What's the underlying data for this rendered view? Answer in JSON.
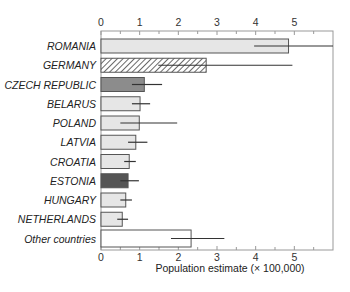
{
  "chart_data": {
    "type": "bar",
    "orientation": "horizontal",
    "title": "",
    "xlabel": "Population estimate (× 100,000)",
    "ylabel": "",
    "xlim": [
      0,
      6
    ],
    "x_ticks": [
      0,
      1,
      2,
      3,
      4,
      5
    ],
    "x_tick_labels": [
      "0",
      "1",
      "2",
      "3",
      "4",
      "5"
    ],
    "minor_ticks_every": 0.5,
    "axis_labels_top_and_bottom": true,
    "grid": false,
    "legend": null,
    "categories": [
      "ROMANIA",
      "GERMANY",
      "CZECH REPUBLIC",
      "BELARUS",
      "POLAND",
      "LATVIA",
      "CROATIA",
      "ESTONIA",
      "HUNGARY",
      "NETHERLANDS",
      "Other countries"
    ],
    "values": [
      4.85,
      2.72,
      1.12,
      1.01,
      0.99,
      0.9,
      0.73,
      0.7,
      0.64,
      0.55,
      2.33
    ],
    "error_low": [
      3.96,
      1.48,
      0.8,
      0.8,
      0.5,
      0.7,
      0.6,
      0.5,
      0.5,
      0.42,
      1.81
    ],
    "error_high": [
      6.0,
      4.95,
      1.58,
      1.27,
      1.97,
      1.2,
      0.9,
      0.98,
      0.8,
      0.7,
      3.19
    ],
    "fills": [
      "#e6e6e6",
      "hatch",
      "#8c8c8c",
      "#e6e6e6",
      "#e6e6e6",
      "#e6e6e6",
      "#e6e6e6",
      "#555555",
      "#e6e6e6",
      "#e6e6e6",
      "#ffffff"
    ]
  },
  "colors": {
    "axis": "#999999",
    "bar_stroke": "#555555",
    "error_bar": "#333333",
    "hatch_line": "#444444"
  }
}
